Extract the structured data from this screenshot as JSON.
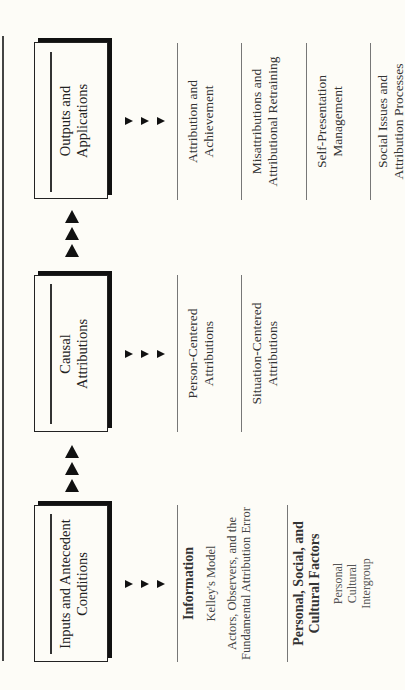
{
  "diagram": {
    "orientation": "rotated -90deg (reads bottom-to-top)",
    "stages": [
      {
        "id": "outputs",
        "title_line1": "Outputs and",
        "title_line2": "Applications",
        "items": [
          {
            "line1": "Attribution and",
            "line2": "Achievement"
          },
          {
            "line1": "Misattributions and",
            "line2": "Attributional Retraining"
          },
          {
            "line1": "Self-Presentation",
            "line2": "Management"
          },
          {
            "line1": "Social Issues and",
            "line2": "Attribution Processes"
          }
        ]
      },
      {
        "id": "causal",
        "title_line1": "Causal",
        "title_line2": "Attributions",
        "items": [
          {
            "line1": "Person-Centered",
            "line2": "Attributions"
          },
          {
            "line1": "Situation-Centered",
            "line2": "Attributions"
          }
        ]
      },
      {
        "id": "inputs",
        "title_line1": "Inputs and Antecedent",
        "title_line2": "Conditions",
        "items": [
          {
            "heading": "Information",
            "sub1": "Kelley's Model",
            "sub2_line1": "Actors, Observers, and the",
            "sub2_line2": "Fundamental Attribution Error"
          },
          {
            "heading_line1": "Personal, Social, and",
            "heading_line2": "Cultural Factors",
            "list": [
              "Personal",
              "Cultural",
              "Intergroup"
            ]
          }
        ]
      }
    ],
    "flow_arrows": {
      "between_stages": "three up-pointing triangles",
      "to_items": "three small right-pointing triangles"
    },
    "colors": {
      "background": "#fdfcf7",
      "box_border": "#222222",
      "shadow": "#111111",
      "divider": "#777777",
      "arrow": "#111111"
    }
  }
}
